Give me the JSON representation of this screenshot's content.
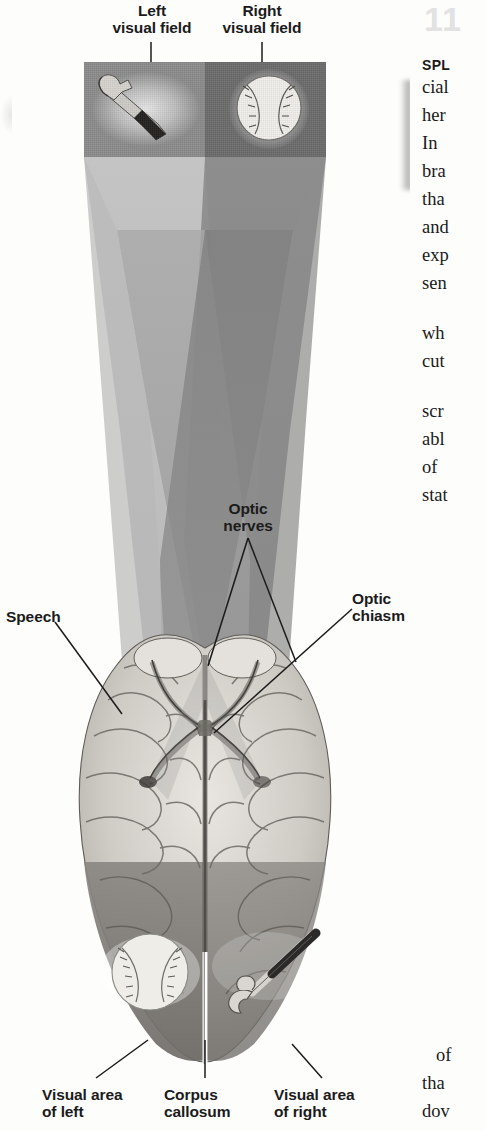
{
  "page": {
    "chapter_number": "11",
    "background_color": "#fdfdfc",
    "width": 486,
    "height": 1131
  },
  "figure": {
    "labels": {
      "left_visual_field": "Left\nvisual field",
      "right_visual_field": "Right\nvisual field",
      "optic_nerves": "Optic\nnerves",
      "optic_chiasm": "Optic\nchiasm",
      "speech": "Speech",
      "visual_area_of_left": "Visual area\nof left",
      "corpus_callosum": "Corpus\ncallosum",
      "visual_area_of_right": "Visual area\nof right"
    },
    "objects": {
      "left_field_object": "hammer",
      "right_field_object": "baseball",
      "left_hemisphere_object": "baseball",
      "right_hemisphere_object": "hammer"
    },
    "colors": {
      "left_field_panel": "#8d8d8d",
      "right_field_panel": "#6d6d6d",
      "cone_light": "#bdbdbd",
      "cone_mid": "#a3a3a3",
      "cone_dark": "#8a8a8a",
      "brain_base": "#d8d5d0",
      "brain_shadow": "#7e7b76",
      "leader_line": "#1b1b1b"
    }
  },
  "body_text": {
    "heading": "SPL",
    "lines": [
      "cial",
      "her",
      "In ",
      "bra",
      "tha",
      "and",
      "exp",
      "sen"
    ],
    "lines2": [
      "wh",
      "cut"
    ],
    "lines3": [
      "scr",
      "abl",
      "of ",
      "stat"
    ],
    "lines4": [
      "of",
      "tha",
      "dov"
    ]
  }
}
